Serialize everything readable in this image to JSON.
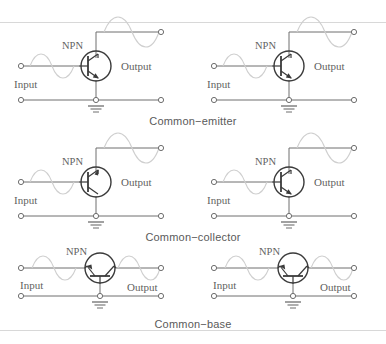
{
  "figure": {
    "title_visible": false,
    "background_color": "#ffffff",
    "wire_color": "#6e6e6e",
    "wave_color": "#cfcfcf",
    "label_color": "#5f5f5f",
    "caption_color": "#5a5a5a",
    "rule_color": "#d8d8d8"
  },
  "labels": {
    "npn": "NPN",
    "input": "Input",
    "output": "Output"
  },
  "captions": {
    "common_emitter": "Common−emitter",
    "common_collector": "Common−collector",
    "common_base": "Common−base"
  },
  "circuits": [
    {
      "id": "common-emitter-left",
      "configuration": "common-emitter",
      "column": "left",
      "row": 1,
      "transistor": "NPN",
      "orientation": "vertical",
      "input_label": "Input",
      "output_label": "Output",
      "npn_label": "NPN",
      "has_ground": true,
      "input_wave": true,
      "output_wave": true
    },
    {
      "id": "common-emitter-right",
      "configuration": "common-emitter",
      "column": "right",
      "row": 1,
      "transistor": "NPN",
      "orientation": "vertical",
      "input_label": "Input",
      "output_label": "Output",
      "npn_label": "NPN",
      "has_ground": true,
      "input_wave": true,
      "output_wave": true
    },
    {
      "id": "common-collector-left",
      "configuration": "common-collector",
      "column": "left",
      "row": 2,
      "transistor": "NPN",
      "orientation": "vertical",
      "input_label": "Input",
      "output_label": "Output",
      "npn_label": "NPN",
      "has_ground": true,
      "input_wave": true,
      "output_wave": true
    },
    {
      "id": "common-collector-right",
      "configuration": "common-collector",
      "column": "right",
      "row": 2,
      "transistor": "NPN",
      "orientation": "vertical",
      "input_label": "Input",
      "output_label": "Output",
      "npn_label": "NPN",
      "has_ground": true,
      "input_wave": true,
      "output_wave": true
    },
    {
      "id": "common-base-left",
      "configuration": "common-base",
      "column": "left",
      "row": 3,
      "transistor": "NPN",
      "orientation": "horizontal",
      "input_label": "Input",
      "output_label": "Output",
      "npn_label": "NPN",
      "has_ground": true,
      "input_wave": true,
      "output_wave": true
    },
    {
      "id": "common-base-right",
      "configuration": "common-base",
      "column": "right",
      "row": 3,
      "transistor": "NPN",
      "orientation": "horizontal",
      "input_label": "Input",
      "output_label": "Output",
      "npn_label": "NPN",
      "has_ground": true,
      "input_wave": true,
      "output_wave": true
    }
  ]
}
